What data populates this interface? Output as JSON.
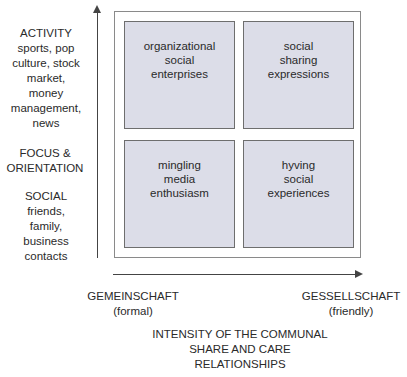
{
  "y_axis": {
    "top_label": "ACTIVITY\nsports, pop\nculture, stock\nmarket,\nmoney\nmanagement,\nnews",
    "middle_label": "FOCUS &\nORIENTATION",
    "bottom_label": "SOCIAL\nfriends,\nfamily,\nbusiness\ncontacts"
  },
  "x_axis": {
    "left_label": "GEMEINSCHAFT\n(formal)",
    "right_label": "GESSELLSCHAFT\n(friendly)",
    "title": "INTENSITY OF THE COMMUNAL\nSHARE AND CARE\nRELATIONSHIPS"
  },
  "quadrants": [
    {
      "position": "top-left",
      "label": "organizational\nsocial\nenterprises"
    },
    {
      "position": "top-right",
      "label": "social\nsharing\nexpressions"
    },
    {
      "position": "bottom-left",
      "label": "mingling\nmedia\nenthusiasm"
    },
    {
      "position": "bottom-right",
      "label": "hyving\nsocial\nexperiences"
    }
  ],
  "colors": {
    "quadrant_fill": "#dcdde8",
    "quadrant_border": "#6e6e6e",
    "axis": "#444444",
    "frame": "#8a8a8a"
  }
}
